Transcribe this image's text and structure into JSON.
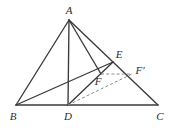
{
  "figure": {
    "kind": "geometry-diagram",
    "width": 174,
    "height": 130,
    "background_color": "#ffffff",
    "stroke_color": "#3a3a3a",
    "dashed_stroke_color": "#8a8a8a",
    "label_color": "#2e2e2e"
  },
  "labels": {
    "A": "A",
    "B": "B",
    "C": "C",
    "D": "D",
    "E": "E",
    "F": "F",
    "Fprime": "F′"
  },
  "chart_data": {
    "type": "diagram",
    "title": "",
    "points": [
      {
        "id": "A",
        "label": "A",
        "x": 69,
        "y": 20,
        "label_x": 69,
        "label_y": 10
      },
      {
        "id": "B",
        "label": "B",
        "x": 16,
        "y": 105,
        "label_x": 13,
        "label_y": 116
      },
      {
        "id": "C",
        "label": "C",
        "x": 158,
        "y": 105,
        "label_x": 160,
        "label_y": 116
      },
      {
        "id": "D",
        "label": "D",
        "x": 68,
        "y": 105,
        "label_x": 68,
        "label_y": 116
      },
      {
        "id": "E",
        "label": "E",
        "x": 113,
        "y": 62,
        "label_x": 119,
        "label_y": 54
      },
      {
        "id": "F",
        "label": "F",
        "x": 101,
        "y": 74,
        "label_x": 98,
        "label_y": 81
      },
      {
        "id": "Fprime",
        "label": "F′",
        "x": 132,
        "y": 74,
        "label_x": 140,
        "label_y": 70
      }
    ],
    "solid_segments": [
      {
        "name": "AB",
        "from": "A",
        "to": "B"
      },
      {
        "name": "AC",
        "from": "A",
        "to": "C"
      },
      {
        "name": "BC",
        "from": "B",
        "to": "C"
      },
      {
        "name": "AD",
        "from": "A",
        "to": "D"
      },
      {
        "name": "AF",
        "from": "A",
        "to": "F"
      },
      {
        "name": "BE",
        "from": "B",
        "to": "E"
      },
      {
        "name": "DE",
        "from": "D",
        "to": "E"
      }
    ],
    "dashed_segments": [
      {
        "name": "FFprime",
        "from": "F",
        "to": "Fprime"
      },
      {
        "name": "DFprime",
        "from": "D",
        "to": "Fprime"
      }
    ]
  }
}
